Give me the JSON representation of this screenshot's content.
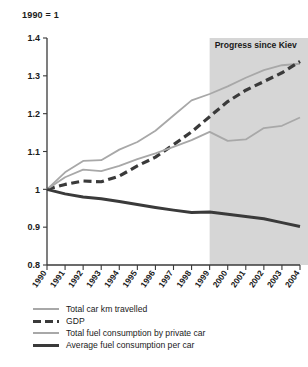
{
  "chart_data": {
    "type": "line",
    "title": "",
    "index_note": "1990 = 1",
    "xlabel": "",
    "ylabel": "",
    "ylim": [
      0.8,
      1.4
    ],
    "yticks": [
      "1.4",
      "1.3",
      "1.2",
      "1.1",
      "1",
      "0.9",
      "0.8"
    ],
    "ytick_values": [
      1.4,
      1.3,
      1.2,
      1.1,
      1.0,
      0.9,
      0.8
    ],
    "grid": false,
    "legend_position": "bottom-left",
    "x": [
      1990,
      1991,
      1992,
      1993,
      1994,
      1995,
      1996,
      1997,
      1998,
      1999,
      2000,
      2001,
      2002,
      2003,
      2004
    ],
    "categories": [
      "1990",
      "1991",
      "1992",
      "1993",
      "1994",
      "1995",
      "1996",
      "1997",
      "1998",
      "1999",
      "2000",
      "2001",
      "2002",
      "2003",
      "2004"
    ],
    "annotations": [
      {
        "text": "Progress since Kiev",
        "type": "shaded-region-label",
        "region_start": 1999,
        "region_end": 2004,
        "color": "#d6d6d6"
      }
    ],
    "series": [
      {
        "name": "Total car km travelled",
        "color": "#a8a8a8",
        "style": "solid",
        "width": 1.8,
        "values": [
          1.0,
          1.045,
          1.075,
          1.077,
          1.105,
          1.125,
          1.155,
          1.195,
          1.235,
          1.252,
          1.272,
          1.295,
          1.315,
          1.328,
          1.332
        ]
      },
      {
        "name": "GDP",
        "color": "#3a3a3a",
        "style": "dashed",
        "width": 3.2,
        "values": [
          1.0,
          1.013,
          1.022,
          1.02,
          1.035,
          1.062,
          1.085,
          1.118,
          1.152,
          1.192,
          1.232,
          1.262,
          1.285,
          1.308,
          1.338
        ]
      },
      {
        "name": "Total fuel consumption by private car",
        "color": "#a8a8a8",
        "style": "solid",
        "width": 1.8,
        "values": [
          1.0,
          1.032,
          1.052,
          1.048,
          1.062,
          1.08,
          1.095,
          1.112,
          1.13,
          1.152,
          1.128,
          1.132,
          1.162,
          1.168,
          1.19
        ]
      },
      {
        "name": "Average fuel consumption per car",
        "color": "#3a3a3a",
        "style": "solid",
        "width": 3.0,
        "values": [
          1.0,
          0.988,
          0.98,
          0.975,
          0.968,
          0.96,
          0.952,
          0.945,
          0.939,
          0.94,
          0.934,
          0.928,
          0.922,
          0.912,
          0.902
        ]
      }
    ]
  },
  "legend": {
    "items": [
      {
        "label": "Total car km travelled",
        "swatch": "light-thin-line-icon"
      },
      {
        "label": "GDP",
        "swatch": "dark-dashed-line-icon"
      },
      {
        "label": "Total fuel consumption by private car",
        "swatch": "light-thin-line-icon"
      },
      {
        "label": "Average fuel consumption per car",
        "swatch": "dark-thick-line-icon"
      }
    ]
  }
}
